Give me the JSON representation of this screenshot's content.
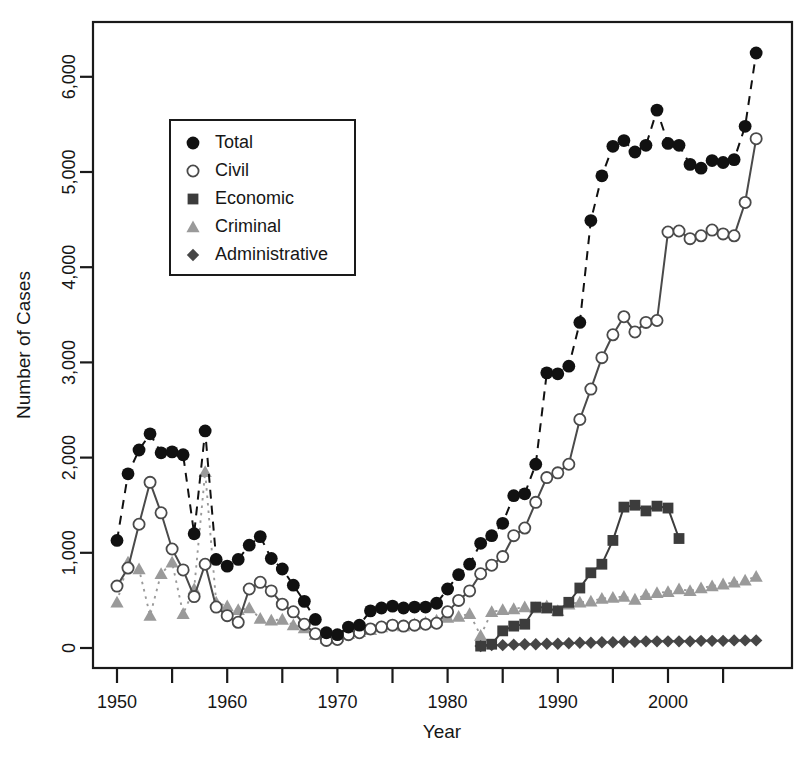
{
  "chart_data": {
    "type": "line",
    "title": "",
    "xlabel": "Year",
    "ylabel": "Number of Cases",
    "xlim": [
      1949,
      2009
    ],
    "ylim": [
      0,
      6500
    ],
    "grid": false,
    "legend_position": "top-left-inside",
    "x_tick_labels": [
      "1950",
      "1960",
      "1970",
      "1980",
      "1990",
      "2000"
    ],
    "x_tick_values": [
      1950,
      1960,
      1970,
      1980,
      1990,
      2000
    ],
    "x_minor_tick_values": [
      1955,
      1965,
      1975,
      1985,
      1995,
      2005
    ],
    "y_tick_labels": [
      "0",
      "1,000",
      "2,000",
      "3,000",
      "4,000",
      "5,000",
      "6,000"
    ],
    "y_tick_values": [
      0,
      1000,
      2000,
      3000,
      4000,
      5000,
      6000
    ],
    "x": [
      1950,
      1951,
      1952,
      1953,
      1954,
      1955,
      1956,
      1957,
      1958,
      1959,
      1960,
      1961,
      1962,
      1963,
      1964,
      1965,
      1966,
      1967,
      1968,
      1969,
      1970,
      1971,
      1972,
      1973,
      1974,
      1975,
      1976,
      1977,
      1978,
      1979,
      1980,
      1981,
      1982,
      1983,
      1984,
      1985,
      1986,
      1987,
      1988,
      1989,
      1990,
      1991,
      1992,
      1993,
      1994,
      1995,
      1996,
      1997,
      1998,
      1999,
      2000,
      2001,
      2002,
      2003,
      2004,
      2005,
      2006,
      2007,
      2008
    ],
    "series": [
      {
        "name": "Total",
        "marker": "filled-circle",
        "color": "#111111",
        "linestyle": "dashed",
        "values": [
          1130,
          1830,
          2080,
          2250,
          2050,
          2060,
          2030,
          1200,
          2280,
          930,
          860,
          930,
          1080,
          1170,
          940,
          830,
          660,
          490,
          300,
          160,
          140,
          220,
          240,
          390,
          420,
          440,
          420,
          430,
          430,
          470,
          620,
          770,
          880,
          1100,
          1180,
          1310,
          1600,
          1620,
          1930,
          2890,
          2880,
          2960,
          3420,
          4490,
          4960,
          5270,
          5330,
          5210,
          5280,
          5650,
          5300,
          5280,
          5080,
          5040,
          5120,
          5100,
          5130,
          5480,
          6250
        ]
      },
      {
        "name": "Civil",
        "marker": "open-circle",
        "color": "#4a4a4a",
        "linestyle": "solid",
        "values": [
          650,
          840,
          1300,
          1740,
          1420,
          1040,
          820,
          540,
          880,
          430,
          340,
          270,
          620,
          690,
          600,
          460,
          380,
          250,
          150,
          80,
          90,
          140,
          160,
          200,
          220,
          240,
          230,
          240,
          250,
          260,
          380,
          500,
          600,
          780,
          870,
          960,
          1180,
          1260,
          1530,
          1790,
          1840,
          1930,
          2400,
          2720,
          3050,
          3290,
          3480,
          3320,
          3420,
          3440,
          4370,
          4380,
          4300,
          4330,
          4390,
          4350,
          4330,
          4680,
          5350
        ]
      },
      {
        "name": "Economic",
        "marker": "filled-square",
        "color": "#3c3c3c",
        "linestyle": "solid",
        "values": [
          null,
          null,
          null,
          null,
          null,
          null,
          null,
          null,
          null,
          null,
          null,
          null,
          null,
          null,
          null,
          null,
          null,
          null,
          null,
          null,
          null,
          null,
          null,
          null,
          null,
          null,
          null,
          null,
          null,
          null,
          null,
          null,
          null,
          20,
          40,
          180,
          230,
          250,
          430,
          420,
          390,
          480,
          630,
          790,
          880,
          1130,
          1480,
          1500,
          1440,
          1490,
          1470,
          1150,
          null,
          null,
          null,
          null,
          null,
          null,
          null
        ]
      },
      {
        "name": "Criminal",
        "marker": "filled-triangle",
        "color": "#9a9a9a",
        "linestyle": "dotted",
        "values": [
          480,
          900,
          830,
          340,
          780,
          900,
          360,
          620,
          1850,
          480,
          440,
          400,
          420,
          310,
          290,
          300,
          240,
          210,
          140,
          100,
          120,
          150,
          170,
          190,
          220,
          240,
          230,
          250,
          270,
          290,
          320,
          330,
          360,
          130,
          380,
          400,
          410,
          430,
          420,
          440,
          390,
          460,
          480,
          490,
          520,
          530,
          540,
          510,
          560,
          580,
          590,
          620,
          600,
          630,
          650,
          670,
          690,
          710,
          750
        ]
      },
      {
        "name": "Administrative",
        "marker": "filled-diamond",
        "color": "#464646",
        "linestyle": "solid",
        "values": [
          null,
          null,
          null,
          null,
          null,
          null,
          null,
          null,
          null,
          null,
          null,
          null,
          null,
          null,
          null,
          null,
          null,
          null,
          null,
          null,
          null,
          null,
          null,
          null,
          null,
          null,
          null,
          null,
          null,
          null,
          null,
          null,
          null,
          20,
          30,
          30,
          35,
          40,
          40,
          45,
          45,
          50,
          55,
          55,
          60,
          60,
          65,
          65,
          70,
          70,
          70,
          70,
          70,
          75,
          75,
          75,
          80,
          80,
          80
        ]
      }
    ]
  },
  "legend": {
    "entries": [
      {
        "label": "Total"
      },
      {
        "label": "Civil"
      },
      {
        "label": "Economic"
      },
      {
        "label": "Criminal"
      },
      {
        "label": "Administrative"
      }
    ]
  }
}
